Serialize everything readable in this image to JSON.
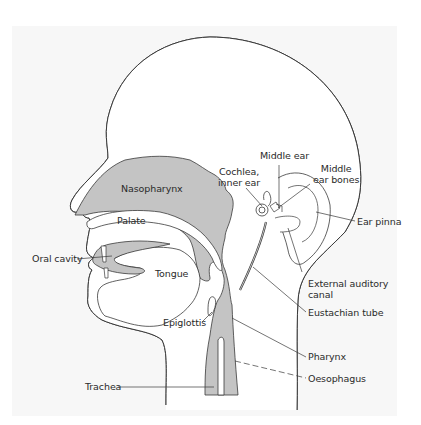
{
  "diagram": {
    "colors": {
      "background": "#ffffff",
      "panel": "#f7f7f7",
      "outline": "#3a3a3a",
      "cavity_fill": "#c4c4c4",
      "label_text": "#2a2a2a"
    },
    "labels": {
      "nasopharynx": "Nasopharynx",
      "palate": "Palate",
      "oral_cavity": "Oral cavity",
      "tongue": "Tongue",
      "epiglottis": "Epiglottis",
      "trachea": "Trachea",
      "middle_ear": "Middle ear",
      "cochlea_line1": "Cochlea,",
      "cochlea_line2": "inner ear",
      "middle_ear_bones_line1": "Middle",
      "middle_ear_bones_line2": "ear bones",
      "ear_pinna": "Ear pinna",
      "external_auditory_canal_line1": "External auditory",
      "external_auditory_canal_line2": "canal",
      "eustachian_tube": "Eustachian tube",
      "pharynx": "Pharynx",
      "oesophagus": "Oesophagus"
    }
  }
}
